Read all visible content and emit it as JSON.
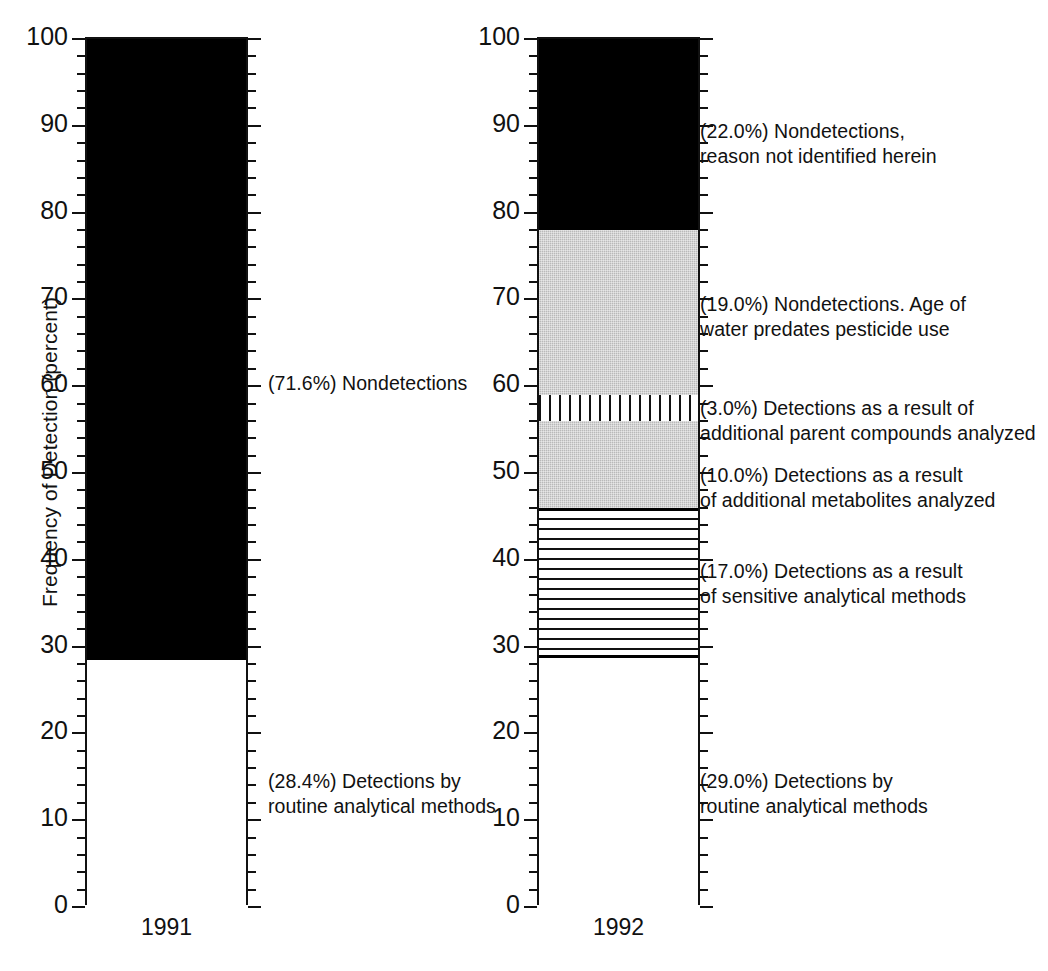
{
  "chart_data": {
    "type": "bar",
    "title": "",
    "subtitle": "",
    "xlabel": "",
    "ylabel": "Frequency of Detection (percent)",
    "ylim": [
      0,
      100
    ],
    "grid": false,
    "legend_position": "inline-annotations",
    "stacked": true,
    "categories": [
      "1991",
      "1992"
    ],
    "y_major_ticks": [
      0,
      10,
      20,
      30,
      40,
      50,
      60,
      70,
      80,
      90,
      100
    ],
    "y_minor_tick_interval": 2,
    "series": [
      {
        "name": "Detections by routine analytical methods",
        "pattern": "white",
        "values": [
          28.4,
          29.0
        ]
      },
      {
        "name": "Detections as a result of sensitive analytical methods",
        "pattern": "horizontal-lines",
        "values": [
          0,
          17.0
        ]
      },
      {
        "name": "Detections as a result of additional metabolites analyzed",
        "pattern": "gray-stipple",
        "values": [
          0,
          10.0
        ]
      },
      {
        "name": "Detections as a result of additional parent compounds analyzed",
        "pattern": "vertical-lines",
        "values": [
          0,
          3.0
        ]
      },
      {
        "name": "Nondetections. Age of water predates pesticide use",
        "pattern": "gray-stipple",
        "values": [
          0,
          19.0
        ]
      },
      {
        "name": "Nondetections",
        "pattern": "black",
        "values": [
          71.6,
          0
        ]
      },
      {
        "name": "Nondetections, reason not identified herein",
        "pattern": "black",
        "values": [
          0,
          22.0
        ]
      }
    ],
    "annotations": [
      {
        "text": "(71.6%) Nondetections",
        "panel": "1991",
        "value": 71.6
      },
      {
        "text": "(28.4%) Detections by\nroutine analytical methods",
        "panel": "1991",
        "value": 28.4
      },
      {
        "text": "(22.0%) Nondetections,\nreason not identified herein",
        "panel": "1992",
        "value": 22.0
      },
      {
        "text": "(19.0%) Nondetections. Age of\nwater predates pesticide use",
        "panel": "1992",
        "value": 19.0
      },
      {
        "text": "(3.0%) Detections as a result of\nadditional parent compounds analyzed",
        "panel": "1992",
        "value": 3.0
      },
      {
        "text": "(10.0%) Detections as a result\nof additional metabolites analyzed",
        "panel": "1992",
        "value": 10.0
      },
      {
        "text": "(17.0%) Detections as a result\nof sensitive analytical methods",
        "panel": "1992",
        "value": 17.0
      },
      {
        "text": "(29.0%) Detections by\nroutine analytical methods",
        "panel": "1992",
        "value": 29.0
      }
    ]
  },
  "axis": {
    "y_title": "Frequency of Detection (percent)",
    "ticks": {
      "t100": "100",
      "t90": "90",
      "t80": "80",
      "t70": "70",
      "t60": "60",
      "t50": "50",
      "t40": "40",
      "t30": "30",
      "t20": "20",
      "t10": "10",
      "t0": "0"
    }
  },
  "panels": {
    "left": {
      "category": "1991",
      "annotations": {
        "nondetections": "(71.6%) Nondetections",
        "routine": "(28.4%) Detections by\nroutine analytical methods"
      }
    },
    "right": {
      "category": "1992",
      "annotations": {
        "nondetect_unknown": "(22.0%) Nondetections,\nreason not identified herein",
        "nondetect_age": "(19.0%) Nondetections. Age of\nwater predates pesticide use",
        "parent_compounds": "(3.0%) Detections as a result of\nadditional parent compounds analyzed",
        "metabolites": "(10.0%) Detections as a result\nof additional metabolites analyzed",
        "sensitive": "(17.0%) Detections as a result\nof sensitive analytical methods",
        "routine": "(29.0%) Detections by\nroutine analytical methods"
      }
    }
  },
  "colors": {
    "ink": "#111111",
    "black_fill": "#000000",
    "gray_fill": "#b9b9b9",
    "white_fill": "#ffffff"
  }
}
